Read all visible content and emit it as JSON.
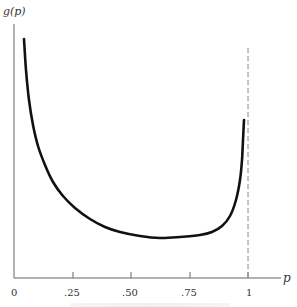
{
  "chart_data": {
    "type": "line",
    "title": "",
    "xlabel": "p",
    "ylabel": "g(p)",
    "xlim": [
      0,
      1.1
    ],
    "x_ticks": [
      "0",
      ".25",
      ".50",
      ".75",
      "1"
    ],
    "x_tick_values": [
      0,
      0.25,
      0.5,
      0.75,
      1
    ],
    "y_ticks": [],
    "grid": false,
    "legend": null,
    "annotations": [
      {
        "type": "vertical-dashed-line",
        "x": 1
      }
    ],
    "series": [
      {
        "name": "g(p)",
        "description": "U-shaped density, unbounded near p=0 and p=1, minimum near p≈0.63",
        "points_px": [
          [
            24,
            39
          ],
          [
            26,
            70
          ],
          [
            29,
            100
          ],
          [
            33,
            125
          ],
          [
            38,
            146
          ],
          [
            45,
            165
          ],
          [
            53,
            182
          ],
          [
            63,
            196
          ],
          [
            75,
            208
          ],
          [
            90,
            219
          ],
          [
            105,
            227
          ],
          [
            120,
            232
          ],
          [
            140,
            236
          ],
          [
            160,
            238
          ],
          [
            180,
            237
          ],
          [
            200,
            235
          ],
          [
            212,
            232
          ],
          [
            222,
            226
          ],
          [
            230,
            216
          ],
          [
            236,
            200
          ],
          [
            240,
            180
          ],
          [
            242,
            160
          ],
          [
            243,
            140
          ],
          [
            244,
            120
          ]
        ]
      }
    ]
  },
  "axis": {
    "y_label": "g(p)",
    "x_label": "p",
    "ticks": [
      ".25",
      ".50",
      ".75",
      "1"
    ],
    "origin": "0"
  }
}
